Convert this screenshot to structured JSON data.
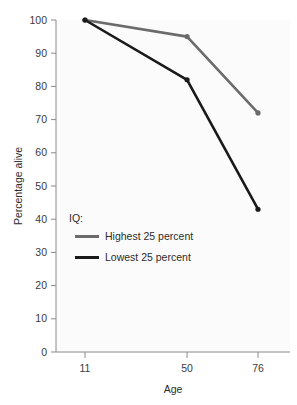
{
  "chart_data": {
    "type": "line",
    "title": "",
    "subtitle": "",
    "xlabel": "Age",
    "ylabel": "Percentage alive",
    "x": [
      11,
      50,
      76
    ],
    "categories": [
      "11",
      "50",
      "76"
    ],
    "xtick_labels": [
      "11",
      "50",
      "76"
    ],
    "ytick_labels": [
      "0",
      "10",
      "20",
      "30",
      "40",
      "50",
      "60",
      "70",
      "80",
      "90",
      "100"
    ],
    "ytick_values": [
      0,
      10,
      20,
      30,
      40,
      50,
      60,
      70,
      80,
      90,
      100
    ],
    "ylim": [
      0,
      100
    ],
    "xlim": [
      11,
      76
    ],
    "grid": false,
    "legend_position": "inside-left",
    "legend_title": "IQ:",
    "series": [
      {
        "name": "Highest 25 percent",
        "values": [
          100,
          95,
          72
        ],
        "color": "#6b6b6b"
      },
      {
        "name": "Lowest 25 percent",
        "values": [
          100,
          82,
          43
        ],
        "color": "#1a1a1a"
      }
    ]
  },
  "axes": {
    "x_title": "Age",
    "y_title": "Percentage alive"
  },
  "legend": {
    "title": "IQ:",
    "entries": [
      {
        "label": "Highest 25 percent",
        "color": "#6b6b6b"
      },
      {
        "label": "Lowest 25 percent",
        "color": "#1a1a1a"
      }
    ]
  },
  "colors": {
    "highest": "#6b6b6b",
    "lowest": "#1a1a1a",
    "axis": "#8a8a8a",
    "text": "#2b2b2b",
    "background": "#ffffff",
    "plot_background": "#fbfbfb"
  }
}
